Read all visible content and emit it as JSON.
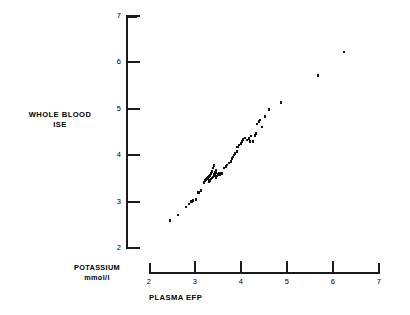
{
  "chart_data": {
    "type": "scatter",
    "title": "",
    "subtitle": "",
    "xlabel": "PLASMA EFP",
    "ylabel": "WHOLE BLOOD ISE",
    "ylabel_line1": "WHOLE BLOOD",
    "ylabel_line2": "ISE",
    "units_label_line1": "POTASSIUM",
    "units_label_line2": "mmol/l",
    "xlim": [
      2,
      7
    ],
    "ylim": [
      2,
      7
    ],
    "xticks": [
      2,
      3,
      4,
      5,
      6,
      7
    ],
    "yticks": [
      2,
      3,
      4,
      5,
      6,
      7
    ],
    "xtick_labels": [
      "2",
      "3",
      "4",
      "5",
      "6",
      "7"
    ],
    "ytick_labels": [
      "2",
      "3",
      "4",
      "5",
      "6",
      "7"
    ],
    "grid": false,
    "legend": false,
    "marker": "square",
    "marker_color": "#111111",
    "axis_color": "#1a1a1a",
    "background": "#ffffff",
    "n_points": 63,
    "points": [
      [
        2.46,
        2.59
      ],
      [
        2.63,
        2.71
      ],
      [
        2.8,
        2.88
      ],
      [
        2.87,
        2.95
      ],
      [
        2.93,
        3.0
      ],
      [
        2.96,
        3.02
      ],
      [
        3.02,
        3.05
      ],
      [
        3.07,
        3.2
      ],
      [
        3.13,
        3.24
      ],
      [
        3.2,
        3.41
      ],
      [
        3.22,
        3.46
      ],
      [
        3.24,
        3.48
      ],
      [
        3.26,
        3.5
      ],
      [
        3.28,
        3.52
      ],
      [
        3.3,
        3.43
      ],
      [
        3.3,
        3.54
      ],
      [
        3.32,
        3.46
      ],
      [
        3.33,
        3.56
      ],
      [
        3.35,
        3.49
      ],
      [
        3.35,
        3.6
      ],
      [
        3.37,
        3.51
      ],
      [
        3.37,
        3.65
      ],
      [
        3.39,
        3.53
      ],
      [
        3.39,
        3.72
      ],
      [
        3.41,
        3.56
      ],
      [
        3.41,
        3.78
      ],
      [
        3.43,
        3.58
      ],
      [
        3.44,
        3.63
      ],
      [
        3.46,
        3.52
      ],
      [
        3.46,
        3.68
      ],
      [
        3.48,
        3.55
      ],
      [
        3.5,
        3.59
      ],
      [
        3.52,
        3.62
      ],
      [
        3.54,
        3.57
      ],
      [
        3.57,
        3.6
      ],
      [
        3.59,
        3.62
      ],
      [
        3.63,
        3.72
      ],
      [
        3.67,
        3.76
      ],
      [
        3.7,
        3.79
      ],
      [
        3.74,
        3.83
      ],
      [
        3.78,
        3.87
      ],
      [
        3.8,
        3.93
      ],
      [
        3.83,
        3.96
      ],
      [
        3.85,
        4.0
      ],
      [
        3.87,
        4.04
      ],
      [
        3.91,
        4.08
      ],
      [
        3.93,
        4.18
      ],
      [
        3.96,
        4.22
      ],
      [
        4.0,
        4.25
      ],
      [
        4.02,
        4.3
      ],
      [
        4.04,
        4.34
      ],
      [
        4.09,
        4.37
      ],
      [
        4.13,
        4.33
      ],
      [
        4.17,
        4.36
      ],
      [
        4.2,
        4.29
      ],
      [
        4.22,
        4.41
      ],
      [
        4.26,
        4.3
      ],
      [
        4.3,
        4.42
      ],
      [
        4.33,
        4.47
      ],
      [
        4.35,
        4.67
      ],
      [
        4.39,
        4.72
      ],
      [
        4.41,
        4.76
      ],
      [
        4.46,
        4.61
      ],
      [
        4.52,
        4.83
      ],
      [
        4.61,
        4.98
      ],
      [
        4.87,
        5.13
      ],
      [
        5.67,
        5.72
      ],
      [
        6.24,
        6.22
      ]
    ]
  },
  "accessibility": {
    "description": "Scatter plot of whole blood ISE potassium versus plasma EFP potassium in mmol/l"
  }
}
